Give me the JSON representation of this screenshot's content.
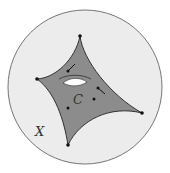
{
  "figure": {
    "surface_label": "C",
    "space_label": "X",
    "colors": {
      "disk_fill": "#ececec",
      "disk_stroke": "#555555",
      "surface_fill": "#8c8c8c",
      "surface_stroke": "#222222",
      "hole_fill": "#ffffff",
      "points": "#111111"
    }
  }
}
